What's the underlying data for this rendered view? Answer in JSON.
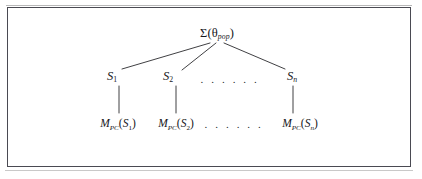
{
  "figure": {
    "type": "hierarchical-tree-diagram",
    "background_color": "#ffffff",
    "frame_color": "#4a4a52",
    "text_color": "#16161a",
    "line_color": "#2a2a2e",
    "root": {
      "id": "root",
      "label_sigma": "Σ(",
      "label_theta": "θ",
      "label_theta_sub": "pop",
      "label_close": ")",
      "plain_text": "Σ(θpop)",
      "x": 217,
      "y": 33
    },
    "level2": [
      {
        "id": "s1",
        "symbol": "S",
        "subscript": "1",
        "plain_text": "S1",
        "x": 112,
        "y": 76
      },
      {
        "id": "s2",
        "symbol": "S",
        "subscript": "2",
        "plain_text": "S2",
        "x": 168,
        "y": 76
      },
      {
        "id": "sn",
        "symbol": "S",
        "subscript": "n",
        "plain_text": "Sn",
        "x": 292,
        "y": 76
      }
    ],
    "level2_ellipsis": {
      "text": ". . . . . .",
      "x": 230,
      "y": 79
    },
    "level3": [
      {
        "id": "mpc-s1",
        "symbol": "M",
        "subscript": "PC",
        "arg_open": "(",
        "arg_symbol": "S",
        "arg_subscript": "1",
        "arg_close": ")",
        "plain_text": "MPC(S1)",
        "x": 118,
        "y": 124
      },
      {
        "id": "mpc-s2",
        "symbol": "M",
        "subscript": "PC",
        "arg_open": "(",
        "arg_symbol": "S",
        "arg_subscript": "2",
        "arg_close": ")",
        "plain_text": "MPC(S2)",
        "x": 176,
        "y": 124
      },
      {
        "id": "mpc-sn",
        "symbol": "M",
        "subscript": "PC",
        "arg_open": "(",
        "arg_symbol": "S",
        "arg_subscript": "n",
        "arg_close": ")",
        "plain_text": "MPC(Sn)",
        "x": 300,
        "y": 124
      }
    ],
    "level3_ellipsis": {
      "text": ". . . . . .",
      "x": 234,
      "y": 124
    },
    "edges": [
      {
        "from": "root",
        "to": "s1",
        "x1": 210,
        "y1": 43,
        "x2": 122,
        "y2": 69
      },
      {
        "from": "root",
        "to": "s2",
        "x1": 216,
        "y1": 43,
        "x2": 182,
        "y2": 70
      },
      {
        "from": "root",
        "to": "sn",
        "x1": 224,
        "y1": 43,
        "x2": 285,
        "y2": 69
      },
      {
        "from": "s1",
        "to": "mpc-s1",
        "x1": 119,
        "y1": 86,
        "x2": 119,
        "y2": 113
      },
      {
        "from": "s2",
        "to": "mpc-s2",
        "x1": 176,
        "y1": 86,
        "x2": 176,
        "y2": 113
      },
      {
        "from": "sn",
        "to": "mpc-sn",
        "x1": 293,
        "y1": 86,
        "x2": 293,
        "y2": 113
      }
    ]
  }
}
